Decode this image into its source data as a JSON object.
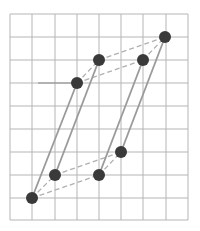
{
  "diagram": {
    "grid": {
      "x_lines": [
        10,
        32,
        55,
        77,
        99,
        121,
        143,
        166,
        188
      ],
      "y_lines": [
        14,
        37,
        60,
        83,
        106,
        129,
        152,
        175,
        198,
        220
      ],
      "color": "#b5b5b5",
      "stub": {
        "x1": 38,
        "y1": 83,
        "x2": 77,
        "y2": 83,
        "color": "#8a8a8a"
      }
    },
    "points": [
      {
        "id": "A",
        "x": 32,
        "y": 198
      },
      {
        "id": "B",
        "x": 55,
        "y": 175
      },
      {
        "id": "C",
        "x": 99,
        "y": 175
      },
      {
        "id": "D",
        "x": 121,
        "y": 152
      },
      {
        "id": "E",
        "x": 77,
        "y": 83
      },
      {
        "id": "F",
        "x": 99,
        "y": 60
      },
      {
        "id": "G",
        "x": 143,
        "y": 60
      },
      {
        "id": "H",
        "x": 165,
        "y": 37
      }
    ],
    "solid_edges": [
      [
        "A",
        "E"
      ],
      [
        "B",
        "F"
      ],
      [
        "C",
        "G"
      ],
      [
        "D",
        "H"
      ]
    ],
    "dashed_edges": [
      [
        "A",
        "B"
      ],
      [
        "A",
        "C"
      ],
      [
        "B",
        "D"
      ],
      [
        "C",
        "D"
      ],
      [
        "E",
        "F"
      ],
      [
        "E",
        "G"
      ],
      [
        "F",
        "H"
      ],
      [
        "G",
        "H"
      ]
    ],
    "colors": {
      "point": "#3a3a3a",
      "solid": "#9a9a9a",
      "dashed": "#b0b0b0"
    },
    "point_radius": 6
  }
}
